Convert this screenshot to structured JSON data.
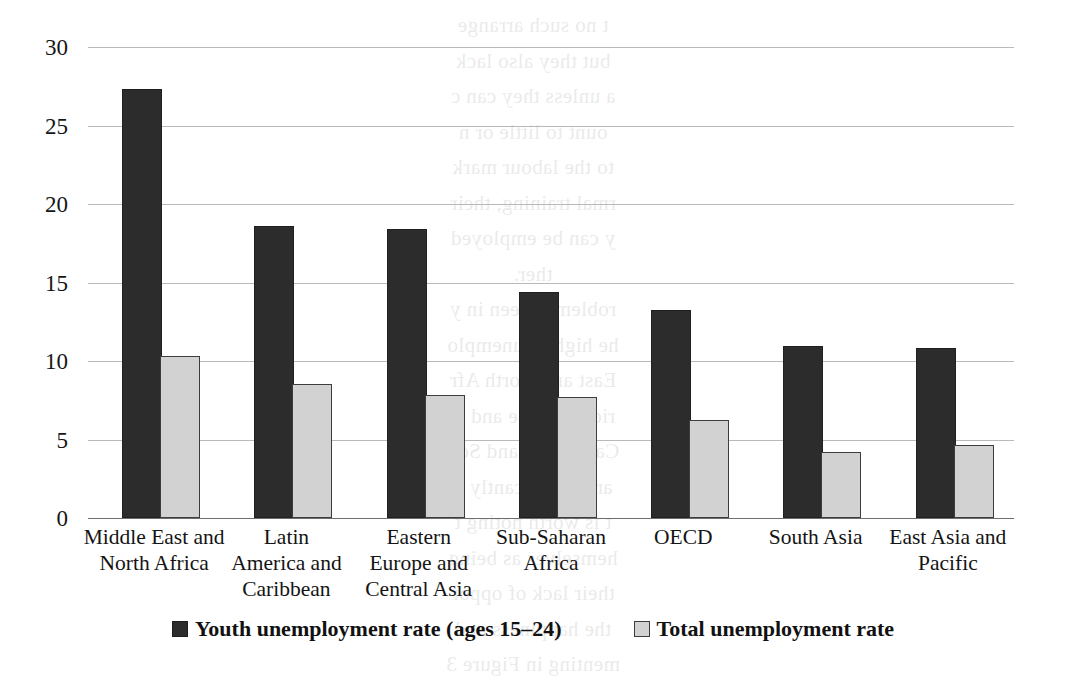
{
  "chart_data": {
    "type": "bar",
    "title": "",
    "xlabel": "",
    "ylabel": "",
    "ylim": [
      0,
      30
    ],
    "yticks": [
      0,
      5,
      10,
      15,
      20,
      25,
      30
    ],
    "ytick_labels": [
      "0",
      "5",
      "10",
      "15",
      "20",
      "25",
      "30"
    ],
    "grid": true,
    "legend_position": "bottom",
    "categories": [
      "Middle East and North Africa",
      "Latin America and Caribbean",
      "Eastern Europe and Central Asia",
      "Sub-Saharan Africa",
      "OECD",
      "South Asia",
      "East Asia and Pacific"
    ],
    "category_lines": [
      [
        "Middle East and",
        "North Africa"
      ],
      [
        "Latin",
        "America and",
        "Caribbean"
      ],
      [
        "Eastern",
        "Europe and",
        "Central Asia"
      ],
      [
        "Sub-Saharan",
        "Africa"
      ],
      [
        "OECD"
      ],
      [
        "South Asia"
      ],
      [
        "East Asia and",
        "Pacific"
      ]
    ],
    "series": [
      {
        "name": "Youth unemployment rate (ages 15–24)",
        "color": "#2c2c2c",
        "values": [
          27.2,
          18.5,
          18.3,
          14.3,
          13.1,
          10.8,
          10.7
        ]
      },
      {
        "name": "Total unemployment rate",
        "color": "#d2d2d2",
        "values": [
          10.2,
          8.4,
          7.7,
          7.6,
          6.1,
          4.1,
          4.5
        ]
      }
    ]
  },
  "legend": {
    "items": [
      {
        "label": "Youth unemployment rate (ages 15–24)",
        "swatch": "dark-swatch"
      },
      {
        "label": "Total unemployment rate",
        "swatch": "light-swatch"
      }
    ]
  },
  "bleed_text": {
    "lines": [
      "t no such arrange",
      "but they also lack",
      "a unless they can c",
      "ount to little or n",
      "to the labour mark",
      "rmal training, their",
      "y can be employed",
      "ther.",
      "roblem is seen in y",
      "he highest unemplo",
      "East and North Afr",
      "rica, Europe and C",
      "Caribbean, and Sou",
      "are significantly h",
      "t is worth noting t",
      "hemselves as being",
      "their lack of oppor",
      "the happiness and",
      "menting in Figure 3"
    ]
  }
}
